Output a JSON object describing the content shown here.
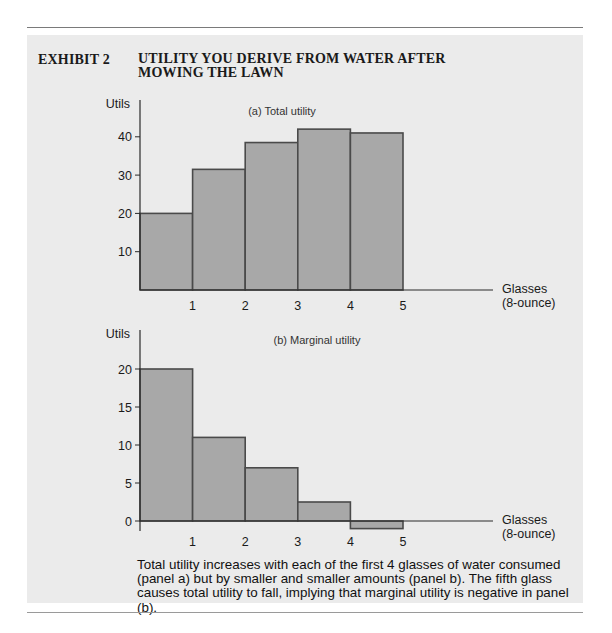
{
  "exhibit": {
    "label": "EXHIBIT 2",
    "title": "UTILITY YOU DERIVE FROM WATER AFTER MOWING THE LAWN"
  },
  "caption": "Total utility increases with each of the first 4 glasses of water consumed (panel a) but by smaller and smaller amounts (panel b). The fifth glass causes total utility to fall, implying that marginal utility is negative in panel (b).",
  "colors": {
    "panel_background": "#ebebeb",
    "bar_fill": "#a8a8a8",
    "bar_stroke": "#4a4a4a",
    "axis": "#2a2a2a"
  },
  "chart_data": [
    {
      "type": "bar",
      "panel": "a",
      "title": "(a) Total utility",
      "ylabel": "Utils",
      "xlabel_line1": "Glasses",
      "xlabel_line2": "(8-ounce)",
      "categories": [
        "1",
        "2",
        "3",
        "4",
        "5"
      ],
      "values": [
        20,
        31.5,
        38.5,
        42,
        41
      ],
      "yticks": [
        10,
        20,
        30,
        40
      ],
      "ylim": [
        0,
        45
      ],
      "xlim": [
        0,
        6.7
      ],
      "grid": false,
      "legend": "none"
    },
    {
      "type": "bar",
      "panel": "b",
      "title": "(b) Marginal utility",
      "ylabel": "Utils",
      "xlabel_line1": "Glasses",
      "xlabel_line2": "(8-ounce)",
      "categories": [
        "1",
        "2",
        "3",
        "4",
        "5"
      ],
      "values": [
        20,
        11,
        7,
        2.5,
        -1
      ],
      "yticks": [
        0,
        5,
        10,
        15,
        20
      ],
      "ylim": [
        -1.5,
        25
      ],
      "xlim": [
        0,
        6.7
      ],
      "grid": false,
      "legend": "none"
    }
  ]
}
